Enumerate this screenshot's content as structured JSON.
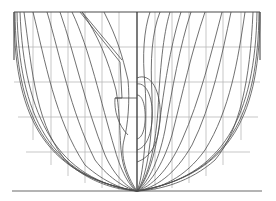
{
  "diagram": {
    "type": "ship-hull-body-plan",
    "colors": {
      "background": "#ffffff",
      "station_lines": "#4d4d4d",
      "grid_lines": "#b9b9b9",
      "baseline": "#6a6a6a"
    },
    "frame": {
      "left": 14,
      "right": 260,
      "top": 12,
      "centerline_x": 137,
      "baseline_y": 191
    },
    "waterlines_y": [
      47,
      82,
      117,
      152
    ],
    "buttocks_x": [
      33,
      51,
      68,
      85,
      102,
      119,
      155,
      172,
      189,
      206,
      223,
      241
    ],
    "halves": {
      "left": "aft stations",
      "right": "forward stations"
    }
  }
}
